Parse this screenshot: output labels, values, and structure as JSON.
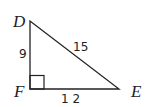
{
  "diagram": {
    "type": "right-triangle",
    "vertices": {
      "D": "D",
      "E": "E",
      "F": "F"
    },
    "sides": {
      "DF": "9",
      "FE": "1 2",
      "DE": "15"
    },
    "right_angle_at": "F"
  }
}
